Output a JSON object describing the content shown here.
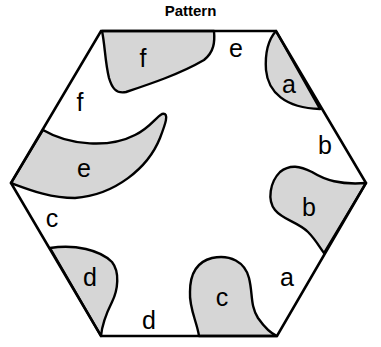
{
  "title": "Pattern",
  "colors": {
    "fill": "#d6d6d6",
    "stroke": "#000000",
    "background": "#ffffff"
  },
  "hexagon": {
    "vertices": [
      [
        101,
        31
      ],
      [
        276,
        31
      ],
      [
        366,
        183
      ],
      [
        277,
        336
      ],
      [
        101,
        336
      ],
      [
        11,
        183
      ]
    ]
  },
  "inner_labels": [
    {
      "id": "f",
      "text": "f",
      "x": 143,
      "y": 58
    },
    {
      "id": "a",
      "text": "a",
      "x": 289,
      "y": 84
    },
    {
      "id": "e",
      "text": "e",
      "x": 84,
      "y": 168
    },
    {
      "id": "b",
      "text": "b",
      "x": 309,
      "y": 207
    },
    {
      "id": "d",
      "text": "d",
      "x": 90,
      "y": 277
    },
    {
      "id": "c",
      "text": "c",
      "x": 222,
      "y": 297
    }
  ],
  "edge_labels": [
    {
      "id": "e",
      "text": "e",
      "x": 236,
      "y": 48
    },
    {
      "id": "f",
      "text": "f",
      "x": 80,
      "y": 102
    },
    {
      "id": "b",
      "text": "b",
      "x": 325,
      "y": 145
    },
    {
      "id": "c",
      "text": "c",
      "x": 52,
      "y": 218
    },
    {
      "id": "a",
      "text": "a",
      "x": 287,
      "y": 277
    },
    {
      "id": "d",
      "text": "d",
      "x": 149,
      "y": 320
    }
  ]
}
